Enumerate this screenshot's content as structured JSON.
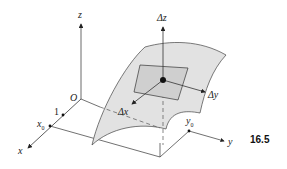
{
  "figure": {
    "number": "16.5",
    "labels": {
      "z": "z",
      "x": "x",
      "y": "y",
      "origin": "O",
      "one": "1",
      "x0": "x",
      "x0_sub": "0",
      "y0": "y",
      "y0_sub": "0",
      "delta_z": "Δz",
      "delta_x": "Δx",
      "delta_y": "Δy"
    },
    "colors": {
      "surface_fill": "#e2e2e2",
      "patch_fill": "#cfcfcf",
      "line": "#333333"
    }
  }
}
